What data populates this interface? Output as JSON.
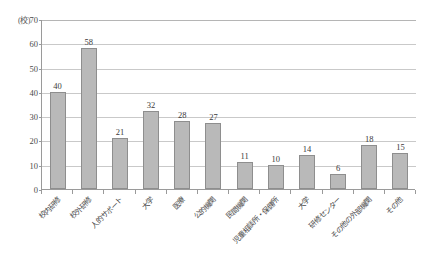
{
  "chart_data": {
    "type": "bar",
    "title": "",
    "subtitle": "",
    "xlabel": "",
    "ylabel": "(校)",
    "ylim": [
      0,
      70
    ],
    "ytick_step": 10,
    "yticks": [
      0,
      10,
      20,
      30,
      40,
      50,
      60,
      70
    ],
    "grid": true,
    "legend": false,
    "legend_position": "none",
    "bar_color": "#b9b9b9",
    "bar_border_color": "#8e8e8e",
    "gridline_color": "#c9c9c9",
    "axis_color": "#9a9a9a",
    "categories": [
      "校内研修",
      "校外研修",
      "人的サポート",
      "大学",
      "医療",
      "公的機関",
      "民間機関",
      "児童相談所・保健所",
      "大学",
      "研修センター",
      "その他の外部機関",
      "その他"
    ],
    "values": [
      40,
      58,
      21,
      32,
      28,
      27,
      11,
      10,
      14,
      6,
      18,
      15
    ],
    "value_labels": [
      "40",
      "58",
      "21",
      "32",
      "28",
      "27",
      "11",
      "10",
      "14",
      "6",
      "18",
      "15"
    ]
  }
}
